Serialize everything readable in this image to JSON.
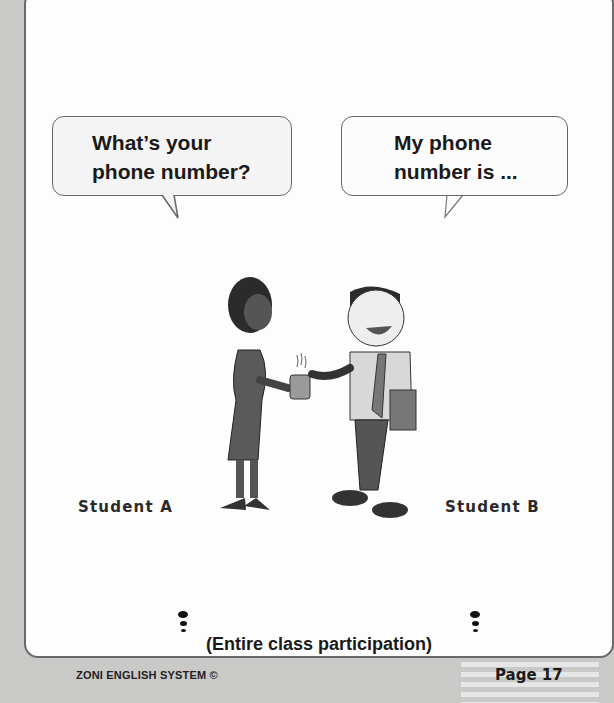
{
  "bubbles": {
    "student_a": {
      "line1": "What’s your",
      "line2": "phone number?"
    },
    "student_b": {
      "line1": "My phone",
      "line2": "number is ..."
    }
  },
  "labels": {
    "student_a": "Student A",
    "student_b": "Student B"
  },
  "instruction": "(Entire class participation)",
  "footer": {
    "brand": "ZONI ENGLISH SYSTEM  ©",
    "page": "Page 17"
  },
  "illustration": {
    "description": "Two students talking; woman holding coffee mug, man with tie holding a book",
    "icons": [
      "woman-figure",
      "man-figure",
      "coffee-mug"
    ]
  },
  "colors": {
    "background": "#c9c9c7",
    "page": "#fdfdfd",
    "border": "#6a6a6a",
    "text": "#1a1a1a"
  }
}
